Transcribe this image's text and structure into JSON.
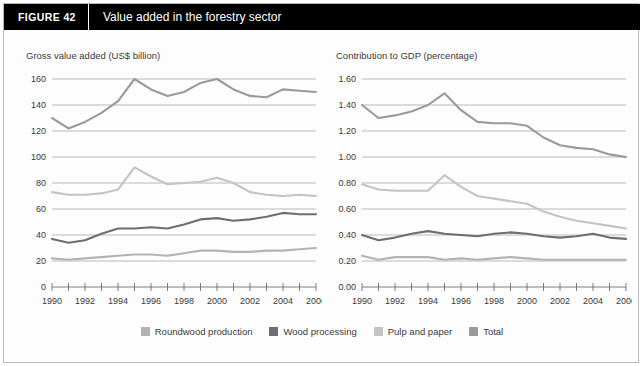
{
  "header": {
    "figure_label": "FIGURE  42",
    "title": "Value added in the forestry sector"
  },
  "colors": {
    "roundwood": "#b3b3b3",
    "wood_processing": "#6e6e6e",
    "pulp_and_paper": "#c4c4c4",
    "total": "#9a9a9a",
    "gridline": "#9b9b9b",
    "axis": "#6e6e6e",
    "header_bg": "#000000",
    "text": "#3a3a3a"
  },
  "legend": {
    "items": [
      {
        "label": "Roundwood production",
        "color": "#b3b3b3"
      },
      {
        "label": "Wood processing",
        "color": "#6e6e6e"
      },
      {
        "label": "Pulp and paper",
        "color": "#c4c4c4"
      },
      {
        "label": "Total",
        "color": "#9a9a9a"
      }
    ]
  },
  "chart_data": [
    {
      "type": "line",
      "id": "gross-value-added",
      "title": "Gross value added (US$ billion)",
      "xlabel": "",
      "ylabel": "Gross value added (US$ billion)",
      "x": [
        1990,
        1991,
        1992,
        1993,
        1994,
        1995,
        1996,
        1997,
        1998,
        1999,
        2000,
        2001,
        2002,
        2003,
        2004,
        2005,
        2006
      ],
      "xtick_labels": [
        "1990",
        "1992",
        "1994",
        "1996",
        "1998",
        "2000",
        "2002",
        "2004",
        "2006"
      ],
      "xtick_values": [
        1990,
        1992,
        1994,
        1996,
        1998,
        2000,
        2002,
        2004,
        2006
      ],
      "ytick_labels": [
        "0",
        "20",
        "40",
        "60",
        "80",
        "100",
        "120",
        "140",
        "160"
      ],
      "ytick_values": [
        0,
        20,
        40,
        60,
        80,
        100,
        120,
        140,
        160
      ],
      "ylim": [
        0,
        160
      ],
      "xlim": [
        1990,
        2006
      ],
      "grid": true,
      "legend_position": "bottom",
      "series": [
        {
          "name": "Roundwood production",
          "color": "#b3b3b3",
          "values": [
            22,
            21,
            22,
            23,
            24,
            25,
            25,
            24,
            26,
            28,
            28,
            27,
            27,
            28,
            28,
            29,
            30
          ]
        },
        {
          "name": "Wood processing",
          "color": "#6e6e6e",
          "values": [
            37,
            34,
            36,
            41,
            45,
            45,
            46,
            45,
            48,
            52,
            53,
            51,
            52,
            54,
            57,
            56,
            56
          ]
        },
        {
          "name": "Pulp and paper",
          "color": "#c4c4c4",
          "values": [
            73,
            71,
            71,
            72,
            75,
            92,
            85,
            79,
            80,
            81,
            84,
            80,
            73,
            71,
            70,
            71,
            70
          ]
        },
        {
          "name": "Total",
          "color": "#9a9a9a",
          "values": [
            130,
            122,
            127,
            134,
            143,
            160,
            152,
            147,
            150,
            157,
            160,
            152,
            147,
            146,
            152,
            151,
            150
          ]
        }
      ]
    },
    {
      "type": "line",
      "id": "contribution-to-gdp",
      "title": "Contribution to GDP (percentage)",
      "xlabel": "",
      "ylabel": "Contribution to GDP (percentage)",
      "x": [
        1990,
        1991,
        1992,
        1993,
        1994,
        1995,
        1996,
        1997,
        1998,
        1999,
        2000,
        2001,
        2002,
        2003,
        2004,
        2005,
        2006
      ],
      "xtick_labels": [
        "1990",
        "1992",
        "1994",
        "1996",
        "1998",
        "2000",
        "2002",
        "2004",
        "2006"
      ],
      "xtick_values": [
        1990,
        1992,
        1994,
        1996,
        1998,
        2000,
        2002,
        2004,
        2006
      ],
      "ytick_labels": [
        "0.00",
        "0.20",
        "0.40",
        "0.60",
        "0.80",
        "1.00",
        "1.20",
        "1.40",
        "1.60"
      ],
      "ytick_values": [
        0.0,
        0.2,
        0.4,
        0.6,
        0.8,
        1.0,
        1.2,
        1.4,
        1.6
      ],
      "ylim": [
        0.0,
        1.6
      ],
      "xlim": [
        1990,
        2006
      ],
      "grid": true,
      "legend_position": "bottom",
      "series": [
        {
          "name": "Roundwood production",
          "color": "#b3b3b3",
          "values": [
            0.24,
            0.21,
            0.23,
            0.23,
            0.23,
            0.21,
            0.22,
            0.21,
            0.22,
            0.23,
            0.22,
            0.21,
            0.21,
            0.21,
            0.21,
            0.21,
            0.21
          ]
        },
        {
          "name": "Wood processing",
          "color": "#6e6e6e",
          "values": [
            0.4,
            0.36,
            0.38,
            0.41,
            0.43,
            0.41,
            0.4,
            0.39,
            0.41,
            0.42,
            0.41,
            0.39,
            0.38,
            0.39,
            0.41,
            0.38,
            0.37
          ]
        },
        {
          "name": "Pulp and paper",
          "color": "#c4c4c4",
          "values": [
            0.79,
            0.75,
            0.74,
            0.74,
            0.74,
            0.86,
            0.77,
            0.7,
            0.68,
            0.66,
            0.64,
            0.58,
            0.54,
            0.51,
            0.49,
            0.47,
            0.45
          ]
        },
        {
          "name": "Total",
          "color": "#9a9a9a",
          "values": [
            1.4,
            1.3,
            1.32,
            1.35,
            1.4,
            1.49,
            1.36,
            1.27,
            1.26,
            1.26,
            1.24,
            1.15,
            1.09,
            1.07,
            1.06,
            1.02,
            1.0
          ]
        }
      ]
    }
  ]
}
